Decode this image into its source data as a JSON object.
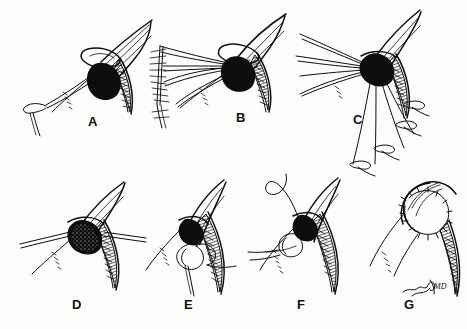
{
  "figure": {
    "background_color": "#fdfdfb",
    "ink_color": "#0d0d0d",
    "width": 467,
    "height": 329,
    "style": "black-and-white line drawing / stipple hatching"
  },
  "panels": [
    {
      "id": "A",
      "label": "A",
      "label_x": 88,
      "label_y": 114,
      "caption": "Exposure of the defect with a single traction suture",
      "row": 1
    },
    {
      "id": "B",
      "label": "B",
      "label_x": 236,
      "label_y": 110,
      "caption": "Multiple retraction sutures tagged and splayed",
      "row": 1
    },
    {
      "id": "C",
      "label": "C",
      "label_x": 353,
      "label_y": 112,
      "caption": "Sutures drawn distally over the stump",
      "row": 1
    },
    {
      "id": "D",
      "label": "D",
      "label_x": 72,
      "label_y": 297,
      "caption": "Defect re-approximated, sutures held laterally",
      "row": 2
    },
    {
      "id": "E",
      "label": "E",
      "label_x": 184,
      "label_y": 297,
      "caption": "Looped suture being tied at the margin",
      "row": 2
    },
    {
      "id": "F",
      "label": "F",
      "label_x": 297,
      "label_y": 297,
      "caption": "Curved needle passing the final stitch",
      "row": 2
    },
    {
      "id": "G",
      "label": "G",
      "label_x": 404,
      "label_y": 297,
      "caption": "Completed closure with interrupted sutures",
      "row": 2
    }
  ],
  "signature": {
    "text": "MD",
    "x": 410,
    "y": 288,
    "note": "cursive artist signature followed by MD"
  }
}
